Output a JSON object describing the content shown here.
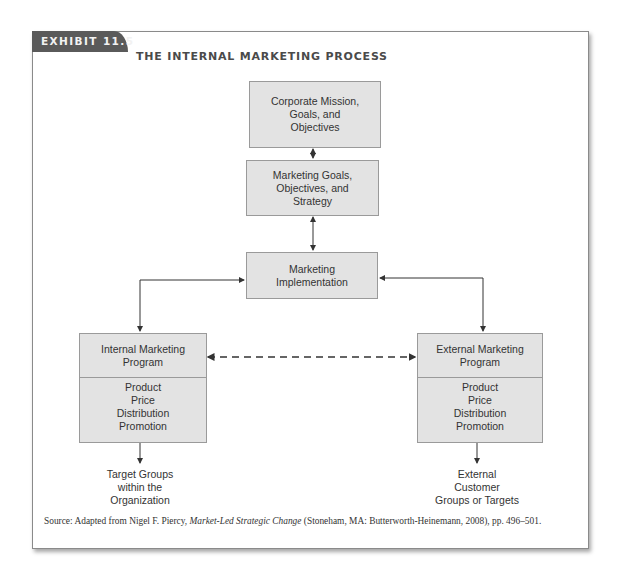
{
  "exhibit": {
    "tab_label": "EXHIBIT 11.5",
    "title": "THE INTERNAL MARKETING PROCESS"
  },
  "colors": {
    "tab_bg": "#5a5a5a",
    "box_fill": "#e3e3e3",
    "box_border": "#9a9a9a",
    "line": "#333333"
  },
  "diagram": {
    "nodes": {
      "corporate": "Corporate Mission,\nGoals, and\nObjectives",
      "marketing_goals": "Marketing Goals,\nObjectives, and\nStrategy",
      "implementation": "Marketing\nImplementation",
      "internal_program_title": "Internal Marketing\nProgram",
      "internal_program_mix": "Product\nPrice\nDistribution\nPromotion",
      "external_program_title": "External Marketing\nProgram",
      "external_program_mix": "Product\nPrice\nDistribution\nPromotion",
      "internal_target": "Target Groups\nwithin the\nOrganization",
      "external_target": "External\nCustomer\nGroups or Targets"
    },
    "edges": [
      {
        "from": "corporate",
        "to": "marketing_goals",
        "style": "solid",
        "direction": "both"
      },
      {
        "from": "marketing_goals",
        "to": "implementation",
        "style": "solid",
        "direction": "both"
      },
      {
        "from": "implementation",
        "to": "internal_program",
        "style": "solid",
        "direction": "both"
      },
      {
        "from": "implementation",
        "to": "external_program",
        "style": "solid",
        "direction": "both"
      },
      {
        "from": "internal_program",
        "to": "external_program",
        "style": "dashed",
        "direction": "both"
      },
      {
        "from": "internal_program",
        "to": "internal_target",
        "style": "solid",
        "direction": "forward"
      },
      {
        "from": "external_program",
        "to": "external_target",
        "style": "solid",
        "direction": "forward"
      }
    ]
  },
  "source": {
    "prefix": "Source: Adapted from Nigel F. Piercy, ",
    "book_title": "Market-Led Strategic Change",
    "suffix": " (Stoneham, MA: Butterworth-Heinemann, 2008), pp. 496–501."
  }
}
